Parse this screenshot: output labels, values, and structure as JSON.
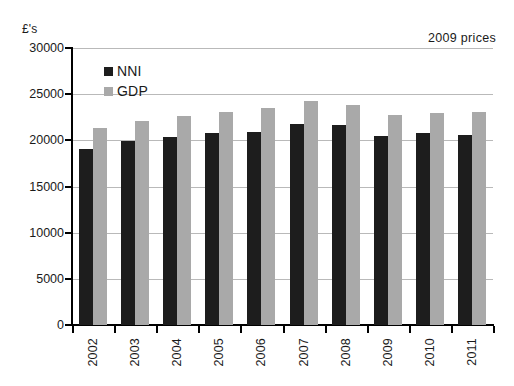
{
  "chart_data": {
    "type": "bar",
    "title": "",
    "subtitle": "",
    "xlabel": "",
    "ylabel": "£'s",
    "unit_label": "£'s",
    "annotation": "2009 prices",
    "categories": [
      "2002",
      "2003",
      "2004",
      "2005",
      "2006",
      "2007",
      "2008",
      "2009",
      "2010",
      "2011"
    ],
    "series": [
      {
        "name": "NNI",
        "color": "#1d1d1d",
        "values": [
          19100,
          19950,
          20400,
          20800,
          20900,
          21750,
          21700,
          20450,
          20800,
          20600
        ]
      },
      {
        "name": "GDP",
        "color": "#a9a9a9",
        "values": [
          21300,
          22050,
          22600,
          23100,
          23550,
          24250,
          23800,
          22800,
          23000,
          23050
        ]
      }
    ],
    "ylim": [
      0,
      30000
    ],
    "ytick_values": [
      0,
      5000,
      10000,
      15000,
      20000,
      25000,
      30000
    ],
    "ytick_labels": [
      "0",
      "5000",
      "10000",
      "15000",
      "20000",
      "25000",
      "30000"
    ],
    "grid": true,
    "grid_axis": "y",
    "legend_position": "top-left-inside",
    "background_color": "#ffffff",
    "axis_color": "#000000",
    "grid_color": "#b9b9b9"
  },
  "legend": {
    "items": [
      {
        "label": "NNI",
        "swatch": "legend-swatch-nni"
      },
      {
        "label": "GDP",
        "swatch": "legend-swatch-gdp"
      }
    ]
  }
}
